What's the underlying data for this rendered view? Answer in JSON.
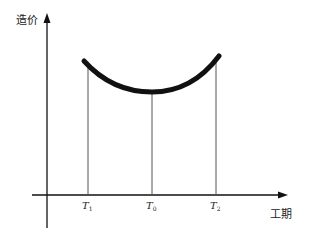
{
  "diagram": {
    "type": "cost-duration curve",
    "y_axis_label": "造价",
    "x_axis_label": "工期",
    "markers": [
      {
        "symbol": "T",
        "subscript": "1",
        "x": 88
      },
      {
        "symbol": "T",
        "subscript": "0",
        "x": 152
      },
      {
        "symbol": "T",
        "subscript": "2",
        "x": 216
      }
    ],
    "curve": {
      "shape": "U-shaped",
      "start": [
        84,
        61
      ],
      "minimum": [
        152,
        92
      ],
      "end": [
        219,
        56
      ],
      "color": "#111111"
    },
    "colors": {
      "axis": "#111111",
      "guide_lines": "#555555",
      "background": "#ffffff"
    }
  }
}
